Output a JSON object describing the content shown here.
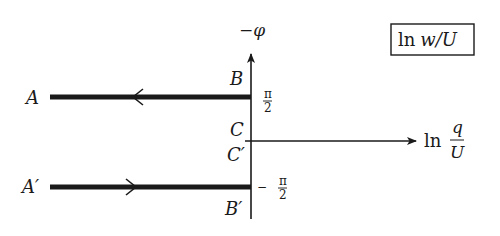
{
  "diagram": {
    "type": "hodograph / complex-plane mapping sketch",
    "box_label": {
      "prefix": "ln",
      "body": "w/U"
    },
    "vertical_axis": {
      "label_sign": "−",
      "label_var": "φ"
    },
    "horizontal_axis": {
      "prefix": "ln",
      "num": "q",
      "den": "U"
    },
    "tick_upper": {
      "num": "π",
      "den": "2"
    },
    "tick_lower": {
      "sign": "−",
      "num": "π",
      "den": "2"
    },
    "points": {
      "A": "A",
      "A_prime": "A′",
      "B": "B",
      "B_prime": "B′",
      "C": "C",
      "C_prime": "C′"
    },
    "paths": [
      {
        "name": "upper-branch",
        "from": "B",
        "to": "A",
        "y_value": "π/2",
        "direction": "left"
      },
      {
        "name": "lower-branch",
        "from": "A′",
        "to": "B′",
        "y_value": "−π/2",
        "direction": "right"
      }
    ],
    "colors": {
      "ink": "#1a1a1a",
      "background": "#ffffff"
    }
  }
}
